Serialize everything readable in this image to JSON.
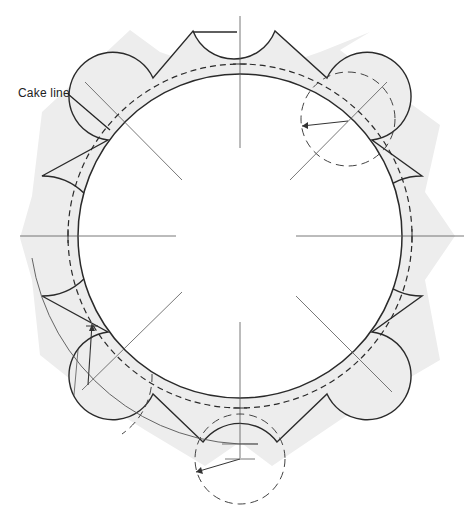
{
  "diagram": {
    "type": "cake board template / cake collar layout",
    "labels": {
      "cake_line": "Cake  line"
    },
    "geometry": {
      "center": [
        240,
        236
      ],
      "inner_circle_radius": 162,
      "cake_line_radius": 172,
      "outer_point_radius": 205,
      "lobe_radius": 44,
      "lobe_center_radius": 178,
      "scallop_radius": 46,
      "scallop_center_radius": 228,
      "lobe_angles_deg": [
        45,
        135,
        225,
        315
      ],
      "scallop_angles_deg": [
        0,
        90,
        180,
        270
      ]
    },
    "colors": {
      "fill": "#ededed",
      "stroke": "#2a2a2a",
      "guide": "#555555",
      "background": "#ffffff"
    }
  }
}
